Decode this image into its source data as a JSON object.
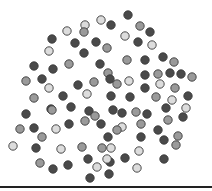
{
  "chart_data": {
    "type": "scatter",
    "title": "",
    "xlabel": "",
    "ylabel": "",
    "grid": false,
    "legend": null,
    "marker": {
      "radius": 4.2,
      "stroke": "#3a3a3a",
      "stroke_width": 0.9
    },
    "categories": [
      "dark",
      "medium",
      "light"
    ],
    "colors": {
      "dark": "#4a4a4a",
      "medium": "#9a9a9a",
      "light": "#dcdcdc"
    },
    "points": [
      {
        "x": 128,
        "y": 15,
        "c": "dark"
      },
      {
        "x": 101,
        "y": 20,
        "c": "light"
      },
      {
        "x": 85,
        "y": 25,
        "c": "light"
      },
      {
        "x": 140,
        "y": 26,
        "c": "medium"
      },
      {
        "x": 111,
        "y": 25,
        "c": "dark"
      },
      {
        "x": 150,
        "y": 32,
        "c": "dark"
      },
      {
        "x": 67,
        "y": 31,
        "c": "light"
      },
      {
        "x": 84,
        "y": 32,
        "c": "medium"
      },
      {
        "x": 52,
        "y": 39,
        "c": "dark"
      },
      {
        "x": 125,
        "y": 36,
        "c": "light"
      },
      {
        "x": 138,
        "y": 42,
        "c": "dark"
      },
      {
        "x": 75,
        "y": 43,
        "c": "dark"
      },
      {
        "x": 96,
        "y": 42,
        "c": "dark"
      },
      {
        "x": 152,
        "y": 45,
        "c": "light"
      },
      {
        "x": 49,
        "y": 51,
        "c": "light"
      },
      {
        "x": 84,
        "y": 53,
        "c": "dark"
      },
      {
        "x": 107,
        "y": 48,
        "c": "medium"
      },
      {
        "x": 127,
        "y": 60,
        "c": "medium"
      },
      {
        "x": 145,
        "y": 60,
        "c": "dark"
      },
      {
        "x": 163,
        "y": 57,
        "c": "dark"
      },
      {
        "x": 174,
        "y": 62,
        "c": "medium"
      },
      {
        "x": 34,
        "y": 66,
        "c": "dark"
      },
      {
        "x": 53,
        "y": 69,
        "c": "dark"
      },
      {
        "x": 69,
        "y": 64,
        "c": "medium"
      },
      {
        "x": 100,
        "y": 64,
        "c": "dark"
      },
      {
        "x": 108,
        "y": 73,
        "c": "medium"
      },
      {
        "x": 158,
        "y": 74,
        "c": "medium"
      },
      {
        "x": 145,
        "y": 75,
        "c": "dark"
      },
      {
        "x": 170,
        "y": 73,
        "c": "dark"
      },
      {
        "x": 181,
        "y": 74,
        "c": "dark"
      },
      {
        "x": 192,
        "y": 77,
        "c": "medium"
      },
      {
        "x": 26,
        "y": 81,
        "c": "medium"
      },
      {
        "x": 42,
        "y": 79,
        "c": "dark"
      },
      {
        "x": 49,
        "y": 88,
        "c": "light"
      },
      {
        "x": 78,
        "y": 85,
        "c": "dark"
      },
      {
        "x": 94,
        "y": 82,
        "c": "medium"
      },
      {
        "x": 110,
        "y": 79,
        "c": "dark"
      },
      {
        "x": 129,
        "y": 81,
        "c": "light"
      },
      {
        "x": 117,
        "y": 84,
        "c": "medium"
      },
      {
        "x": 145,
        "y": 88,
        "c": "dark"
      },
      {
        "x": 160,
        "y": 84,
        "c": "light"
      },
      {
        "x": 175,
        "y": 88,
        "c": "medium"
      },
      {
        "x": 34,
        "y": 98,
        "c": "medium"
      },
      {
        "x": 63,
        "y": 96,
        "c": "dark"
      },
      {
        "x": 87,
        "y": 94,
        "c": "light"
      },
      {
        "x": 111,
        "y": 96,
        "c": "dark"
      },
      {
        "x": 130,
        "y": 97,
        "c": "dark"
      },
      {
        "x": 156,
        "y": 97,
        "c": "medium"
      },
      {
        "x": 172,
        "y": 100,
        "c": "light"
      },
      {
        "x": 188,
        "y": 96,
        "c": "dark"
      },
      {
        "x": 51,
        "y": 109,
        "c": "dark"
      },
      {
        "x": 71,
        "y": 107,
        "c": "dark"
      },
      {
        "x": 89,
        "y": 111,
        "c": "dark"
      },
      {
        "x": 113,
        "y": 110,
        "c": "dark"
      },
      {
        "x": 136,
        "y": 112,
        "c": "medium"
      },
      {
        "x": 166,
        "y": 108,
        "c": "dark"
      },
      {
        "x": 186,
        "y": 108,
        "c": "light"
      },
      {
        "x": 26,
        "y": 114,
        "c": "dark"
      },
      {
        "x": 52,
        "y": 110,
        "c": "medium"
      },
      {
        "x": 95,
        "y": 116,
        "c": "medium"
      },
      {
        "x": 122,
        "y": 113,
        "c": "dark"
      },
      {
        "x": 147,
        "y": 114,
        "c": "dark"
      },
      {
        "x": 168,
        "y": 120,
        "c": "medium"
      },
      {
        "x": 183,
        "y": 117,
        "c": "dark"
      },
      {
        "x": 20,
        "y": 129,
        "c": "medium"
      },
      {
        "x": 34,
        "y": 128,
        "c": "dark"
      },
      {
        "x": 56,
        "y": 129,
        "c": "light"
      },
      {
        "x": 69,
        "y": 124,
        "c": "dark"
      },
      {
        "x": 85,
        "y": 121,
        "c": "medium"
      },
      {
        "x": 101,
        "y": 124,
        "c": "dark"
      },
      {
        "x": 122,
        "y": 127,
        "c": "light"
      },
      {
        "x": 141,
        "y": 124,
        "c": "medium"
      },
      {
        "x": 158,
        "y": 130,
        "c": "dark"
      },
      {
        "x": 42,
        "y": 137,
        "c": "medium"
      },
      {
        "x": 13,
        "y": 146,
        "c": "light"
      },
      {
        "x": 36,
        "y": 148,
        "c": "dark"
      },
      {
        "x": 61,
        "y": 149,
        "c": "light"
      },
      {
        "x": 82,
        "y": 147,
        "c": "medium"
      },
      {
        "x": 102,
        "y": 148,
        "c": "medium"
      },
      {
        "x": 108,
        "y": 137,
        "c": "dark"
      },
      {
        "x": 117,
        "y": 130,
        "c": "medium"
      },
      {
        "x": 141,
        "y": 137,
        "c": "dark"
      },
      {
        "x": 164,
        "y": 140,
        "c": "dark"
      },
      {
        "x": 178,
        "y": 136,
        "c": "medium"
      },
      {
        "x": 40,
        "y": 163,
        "c": "medium"
      },
      {
        "x": 53,
        "y": 169,
        "c": "dark"
      },
      {
        "x": 68,
        "y": 165,
        "c": "dark"
      },
      {
        "x": 88,
        "y": 159,
        "c": "dark"
      },
      {
        "x": 97,
        "y": 167,
        "c": "light"
      },
      {
        "x": 110,
        "y": 162,
        "c": "dark"
      },
      {
        "x": 125,
        "y": 158,
        "c": "dark"
      },
      {
        "x": 139,
        "y": 151,
        "c": "light"
      },
      {
        "x": 164,
        "y": 159,
        "c": "dark"
      },
      {
        "x": 176,
        "y": 145,
        "c": "medium"
      },
      {
        "x": 90,
        "y": 178,
        "c": "dark"
      },
      {
        "x": 109,
        "y": 174,
        "c": "dark"
      },
      {
        "x": 137,
        "y": 168,
        "c": "light"
      },
      {
        "x": 107,
        "y": 159,
        "c": "light"
      },
      {
        "x": 111,
        "y": 148,
        "c": "light"
      }
    ]
  },
  "axis": {
    "color": "#222222"
  }
}
